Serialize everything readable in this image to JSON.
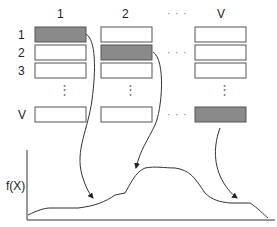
{
  "columns": [
    "1",
    "2",
    "V"
  ],
  "column_ellipsis": "· · ·",
  "rows": [
    "1",
    "2",
    "3",
    "V"
  ],
  "row_ellipsis": "⋮",
  "y_axis_label": "f(X)",
  "colors": {
    "filled": "#8a8a8a",
    "stroke": "#555555",
    "empty": "#ffffff"
  }
}
